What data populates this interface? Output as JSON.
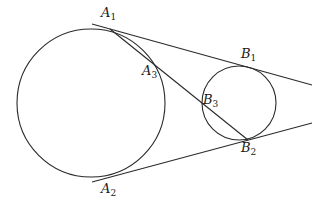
{
  "diagram": {
    "circles": [
      {
        "id": "large-circle",
        "cx": 91,
        "cy": 103,
        "r": 74
      },
      {
        "id": "small-circle",
        "cx": 239,
        "cy": 103,
        "r": 37
      }
    ],
    "lines": [
      {
        "id": "upper-tangent",
        "x1": 92,
        "y1": 24,
        "x2": 312,
        "y2": 85
      },
      {
        "id": "lower-tangent",
        "x1": 92,
        "y1": 182,
        "x2": 312,
        "y2": 123
      },
      {
        "id": "chord-a1-b2",
        "x1": 110,
        "y1": 29,
        "x2": 248,
        "y2": 140
      }
    ],
    "points": {
      "A1": {
        "letter": "A",
        "sub": "1",
        "x": 110,
        "y": 29
      },
      "A2": {
        "letter": "A",
        "sub": "2",
        "x": 115,
        "y": 176
      },
      "A3": {
        "letter": "A",
        "sub": "3",
        "x": 157,
        "y": 67
      },
      "B1": {
        "letter": "B",
        "sub": "1",
        "x": 244,
        "y": 66
      },
      "B2": {
        "letter": "B",
        "sub": "2",
        "x": 248,
        "y": 140
      },
      "B3": {
        "letter": "B",
        "sub": "3",
        "x": 203,
        "y": 105
      }
    },
    "stroke_color": "#2a2a2a"
  }
}
